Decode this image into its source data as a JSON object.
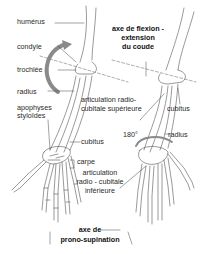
{
  "diagram": {
    "type": "anatomical-illustration",
    "colors": {
      "lines": "#555555",
      "arrow": "#8a8a8a",
      "background": "#ffffff",
      "text": "#222222"
    },
    "left_figure": {
      "labels": {
        "humerus": "humérus",
        "condyle": "condyle",
        "trochlee": "trochlée",
        "radius": "radius",
        "apophyses_1": "apophyses",
        "apophyses_2": "styloïdes",
        "cubitus": "cubitus",
        "carpe": "carpe"
      }
    },
    "right_figure": {
      "labels": {
        "axe_flexion_1": "axe de flexion -",
        "axe_flexion_2": "extension",
        "axe_flexion_3": "du coude",
        "art_sup_1": "articulation radio-",
        "art_sup_2": "cubitale supérieure",
        "cubitus": "cubitus",
        "radius": "radius",
        "angle": "180°",
        "art_inf_1": "articulation",
        "art_inf_2": "radio - cubitale",
        "art_inf_3": "inférieure"
      }
    },
    "bottom": {
      "axe_prono_1": "axe de",
      "axe_prono_2": "prono-supination"
    }
  }
}
